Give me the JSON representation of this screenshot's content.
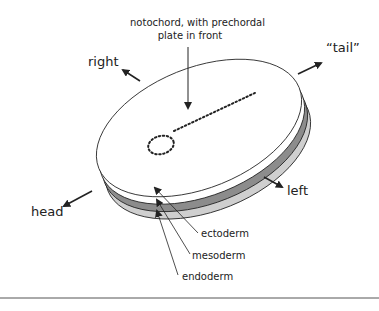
{
  "diagram": {
    "title_label": "notochord, with prechordal",
    "title_label_line2": "plate in front",
    "directions": {
      "right": "right",
      "tail": "“tail”",
      "left": "left",
      "head": "head"
    },
    "layers": {
      "ectoderm": "ectoderm",
      "mesoderm": "mesoderm",
      "endoderm": "endoderm"
    },
    "colors": {
      "ectoderm": "#ffffff",
      "mesoderm": "#8c8c8c",
      "endoderm": "#cfcfcf",
      "outline": "#222222"
    }
  }
}
